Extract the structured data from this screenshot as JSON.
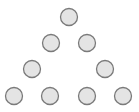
{
  "diagram": {
    "type": "triangle-arrangement",
    "style": {
      "fill": "#e4e4e4",
      "stroke": "#7a7a7a",
      "stroke_width": 1.3,
      "radius": 8.5
    },
    "rows": [
      {
        "row": 1,
        "nodes": [
          {
            "cx": 69,
            "cy": 17
          }
        ]
      },
      {
        "row": 2,
        "nodes": [
          {
            "cx": 51,
            "cy": 43
          },
          {
            "cx": 87,
            "cy": 43
          }
        ]
      },
      {
        "row": 3,
        "nodes": [
          {
            "cx": 32,
            "cy": 69
          },
          {
            "cx": 105,
            "cy": 69
          }
        ]
      },
      {
        "row": 4,
        "nodes": [
          {
            "cx": 14,
            "cy": 96
          },
          {
            "cx": 50,
            "cy": 96
          },
          {
            "cx": 87,
            "cy": 96
          },
          {
            "cx": 123,
            "cy": 96
          }
        ]
      }
    ]
  }
}
